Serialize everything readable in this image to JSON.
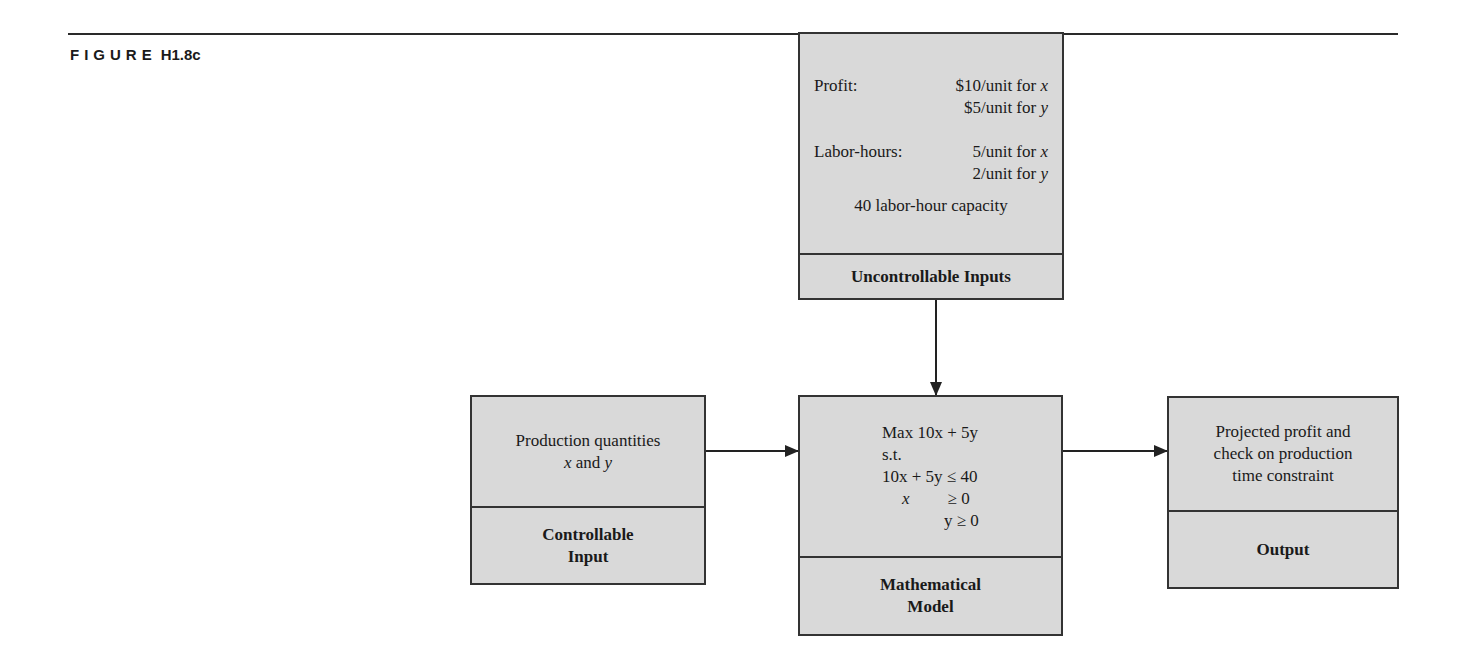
{
  "figure": {
    "label_prefix": "FIGURE",
    "label_number": "H1.8c"
  },
  "boxes": {
    "uncontrollable": {
      "profit_label": "Profit:",
      "profit_x": "$10/unit for ",
      "profit_y": "$5/unit for ",
      "labor_label": "Labor-hours:",
      "labor_x": "5/unit for ",
      "labor_y": "2/unit for ",
      "var_x": "x",
      "var_y": "y",
      "capacity": "40 labor-hour capacity",
      "title": "Uncontrollable Inputs"
    },
    "controllable": {
      "line1": "Production quantities",
      "line2_var_x": "x",
      "line2_mid": " and ",
      "line2_var_y": "y",
      "title_line1": "Controllable",
      "title_line2": "Input"
    },
    "model": {
      "objective": "Max 10x + 5y",
      "st": "s.t.",
      "constraint1": "10x + 5y ≤ 40",
      "constraint2_var": "x",
      "constraint2_rel": "≥ 0",
      "constraint3": "y ≥ 0",
      "title_line1": "Mathematical",
      "title_line2": "Model"
    },
    "output": {
      "line1": "Projected profit and",
      "line2": "check on production",
      "line3": "time constraint",
      "title": "Output"
    }
  }
}
